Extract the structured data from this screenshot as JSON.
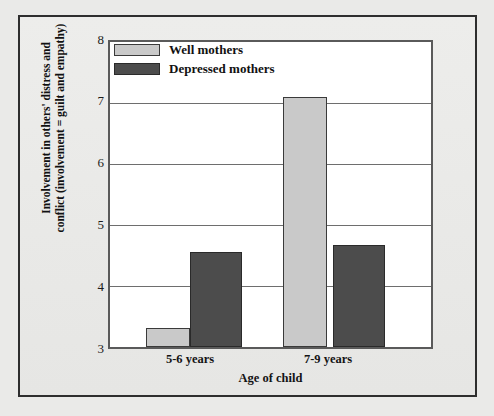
{
  "chart_data": {
    "type": "bar",
    "title": "",
    "subtitle": "",
    "xlabel": "Age of child",
    "ylabel": "Involvement in others' distress and conflict (involvement = guilt and empathy)",
    "ylabel_line1": "Involvement in others' distress and",
    "ylabel_line2": "conflict (involvement = guilt and empathy)",
    "categories": [
      "5-6 years",
      "7-9 years"
    ],
    "series": [
      {
        "name": "Well mothers",
        "values": [
          3.31,
          7.1
        ],
        "color": "#c9c9c9"
      },
      {
        "name": "Depressed mothers",
        "values": [
          4.56,
          4.68
        ],
        "color": "#4c4c4c"
      }
    ],
    "ylim": [
      3,
      8
    ],
    "yticks": [
      3,
      4,
      5,
      6,
      7,
      8
    ],
    "ytick_labels": [
      "3",
      "4",
      "5",
      "6",
      "7",
      "8"
    ],
    "grid": true,
    "grid_axis": "y",
    "legend_position": "top-left-inside",
    "xtick_labels": [
      "5-6 years",
      "7-9 years"
    ]
  },
  "legend": {
    "entries": [
      {
        "label": "Well mothers",
        "swatch": "well"
      },
      {
        "label": "Depressed mothers",
        "swatch": "depressed"
      }
    ]
  },
  "axes": {
    "y_tick_0": "8",
    "y_tick_1": "7",
    "y_tick_2": "6",
    "y_tick_3": "5",
    "y_tick_4": "4",
    "y_tick_5": "3"
  },
  "colors": {
    "well_bar": "#c9c9c9",
    "depressed_bar": "#4c4c4c",
    "plot_background": "#ffffff",
    "figure_background": "#eaeae8",
    "frame": "#2e2e2e",
    "gridline": "#6e6e6e"
  }
}
